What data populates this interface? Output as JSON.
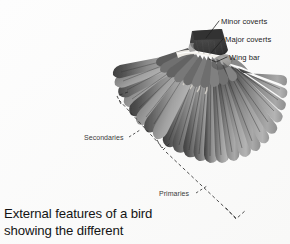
{
  "figure": {
    "background_color": "#fcfcfc",
    "annotations": [
      {
        "id": "minor-coverts",
        "label": "Minor coverts"
      },
      {
        "id": "major-coverts",
        "label": "Major coverts"
      },
      {
        "id": "wing-bar",
        "label": "Wing bar"
      },
      {
        "id": "secondaries",
        "label": "Secondaries"
      },
      {
        "id": "primaries",
        "label": "Primaries"
      }
    ],
    "palette": {
      "feather_dark": "#4a4a4a",
      "feather_mid": "#7d7d7d",
      "feather_light": "#b9b9b9",
      "covert_block": "#3b3b3b",
      "wing_bar_white": "#f2f0ea",
      "leader_line": "#2a2a2a",
      "bracket_line": "#2f2f2f",
      "text": "#1c1c1c"
    }
  },
  "caption": {
    "line1": "External features of a bird",
    "line2": "showing the different"
  }
}
